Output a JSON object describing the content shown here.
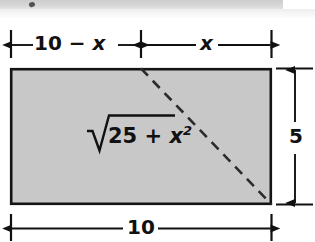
{
  "figure": {
    "background_color": "#ffffff",
    "rect_fill_color": "#c8c8c8",
    "line_color": "#111111",
    "artifact": {
      "name": "scan-edge-strip",
      "color": "#cfcfcf"
    },
    "shape": {
      "type": "rectangle",
      "width_value": "10",
      "height_value": "5",
      "diagonal_style": "dashed"
    },
    "dimensions": {
      "top_left_label": "10 − x",
      "top_left_parts": {
        "number": "10",
        "operator": "−",
        "variable": "x"
      },
      "top_right_label": "x",
      "bottom_label": "10",
      "right_label": "5"
    },
    "expression": {
      "full": "√(25 + x²)",
      "radical_symbol": "√",
      "radicand_number": "25",
      "radicand_operator": "+",
      "radicand_variable": "x",
      "radicand_exponent": "2"
    },
    "geometry": {
      "rect_left": 10,
      "rect_top": 68,
      "rect_right": 272,
      "rect_bottom": 205,
      "midpoint_x": 141,
      "diagonal_start": "141,68",
      "diagonal_end": "272,205"
    }
  }
}
